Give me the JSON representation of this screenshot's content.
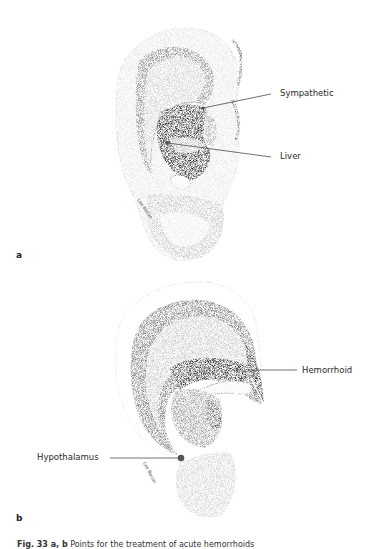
{
  "figure": {
    "panels": [
      {
        "letter": "a",
        "labels": [
          {
            "text": "Sympathetic"
          },
          {
            "text": "Liver"
          }
        ]
      },
      {
        "letter": "b",
        "labels": [
          {
            "text": "Hemorrhoid"
          },
          {
            "text": "Hypothalamus"
          }
        ]
      }
    ],
    "caption": {
      "prefix": "Fig. 33 a, b",
      "text": "Points for the treatment of acute hemorrhoids"
    }
  }
}
